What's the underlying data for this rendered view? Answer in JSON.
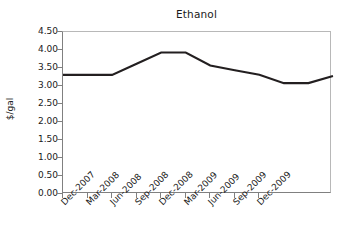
{
  "chart_data": {
    "type": "line",
    "title": "Ethanol",
    "xlabel": "",
    "ylabel": "$/gal",
    "ylim": [
      0.0,
      4.5
    ],
    "ytick_labels": [
      "0.00",
      "0.50",
      "1.00",
      "1.50",
      "2.00",
      "2.50",
      "3.00",
      "3.50",
      "4.00",
      "4.50"
    ],
    "ytick_values": [
      0.0,
      0.5,
      1.0,
      1.5,
      2.0,
      2.5,
      3.0,
      3.5,
      4.0,
      4.5
    ],
    "grid": false,
    "legend": "none",
    "categories": [
      "Dec-2007",
      "Mar-2008",
      "Jun-2008",
      "Sep-2008",
      "Dec-2008",
      "Mar-2009",
      "Jun-2009",
      "Sep-2009",
      "Dec-2009"
    ],
    "xtick_labels": [
      "Dec-2007",
      "Mar-2008",
      "Jun-2008",
      "Sep-2008",
      "Dec-2008",
      "Mar-2009",
      "Jun-2009",
      "Sep-2009",
      "Dec-2009"
    ],
    "series": [
      {
        "name": "Ethanol",
        "color": "#231f20",
        "x": [
          0,
          1,
          2,
          3,
          4,
          5,
          6,
          7,
          8,
          9
        ],
        "values": [
          3.31,
          3.31,
          3.31,
          3.62,
          3.93,
          3.93,
          3.57,
          3.44,
          3.31,
          3.08
        ]
      }
    ],
    "data_points_extended": {
      "x_index": [
        0,
        1,
        2,
        3,
        4,
        5,
        6,
        7,
        8,
        9,
        10
      ],
      "values": [
        3.31,
        3.31,
        3.31,
        3.62,
        3.93,
        3.93,
        3.57,
        3.44,
        3.31,
        3.08,
        3.08
      ],
      "final_value": 3.28
    }
  }
}
